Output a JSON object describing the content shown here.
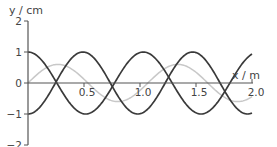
{
  "chart_data": {
    "type": "line",
    "title": "",
    "xlabel": "x / m",
    "ylabel": "y / cm",
    "xlim": [
      0,
      2.0
    ],
    "ylim": [
      -2,
      2
    ],
    "x_ticks": [
      0.5,
      1.0,
      1.5,
      2.0
    ],
    "x_tick_labels": [
      "0.5",
      "1.0",
      "1.5",
      "2.0"
    ],
    "y_ticks": [
      2,
      1,
      0,
      -1,
      -2
    ],
    "y_tick_labels": [
      "2",
      "1",
      "0",
      "−1",
      "−2"
    ],
    "grid": false,
    "legend": null,
    "series": [
      {
        "name": "wave-a",
        "color": "#3a3a3a",
        "form": "cosine",
        "amplitude": 1.0,
        "wavelength": 1.03,
        "phase_sign": 1,
        "key_points": [
          [
            0,
            1
          ],
          [
            0.52,
            -1
          ],
          [
            1.07,
            1
          ],
          [
            1.55,
            -1
          ],
          [
            2.0,
            0.95
          ]
        ]
      },
      {
        "name": "wave-b",
        "color": "#3a3a3a",
        "form": "negative-cosine",
        "amplitude": 1.0,
        "wavelength": 0.98,
        "phase_sign": -1,
        "key_points": [
          [
            0,
            -1
          ],
          [
            0.47,
            1
          ],
          [
            0.96,
            -1
          ],
          [
            1.47,
            1
          ],
          [
            1.95,
            -1
          ],
          [
            2.0,
            -1
          ]
        ]
      },
      {
        "name": "resultant-wave",
        "color": "#c8c8c8",
        "form": "sine",
        "amplitude": 0.6,
        "wavelength": 1.07,
        "key_points": [
          [
            0,
            0
          ],
          [
            0.27,
            0.6
          ],
          [
            0.54,
            0
          ],
          [
            0.8,
            -0.6
          ],
          [
            1.07,
            0
          ],
          [
            1.33,
            0.6
          ],
          [
            1.6,
            0
          ],
          [
            1.87,
            -0.6
          ],
          [
            2.0,
            -0.45
          ]
        ]
      }
    ]
  },
  "axes": {
    "y_title": "y / cm",
    "x_title": "x / m"
  }
}
